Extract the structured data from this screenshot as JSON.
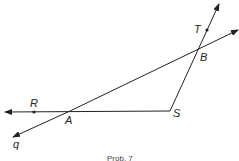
{
  "diagram": {
    "labels": {
      "T": "T",
      "B": "B",
      "R": "R",
      "A": "A",
      "S": "S",
      "q": "q"
    },
    "caption": "Prob. 7",
    "line_color": "#222222"
  }
}
